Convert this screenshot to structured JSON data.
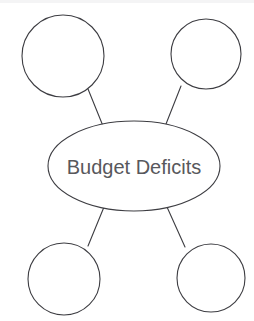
{
  "canvas": {
    "width": 254,
    "height": 321,
    "background": "#ffffff"
  },
  "diagram": {
    "type": "concept-map",
    "title": "Budget Deficits",
    "style": {
      "stroke_color": "#3d3d42",
      "stroke_width": 1.1,
      "node_fill": "#ffffff",
      "text_color": "#58585c",
      "font_size": 20
    },
    "center_node": {
      "label": "Budget Deficits",
      "shape": "ellipse",
      "cx": 134,
      "cy": 166,
      "rx": 86,
      "ry": 45
    },
    "branch_nodes": [
      {
        "name": "top-left-blank-node",
        "label": "",
        "shape": "circle",
        "cx": 63,
        "cy": 56,
        "r": 41
      },
      {
        "name": "top-right-blank-node",
        "label": "",
        "shape": "circle",
        "cx": 206,
        "cy": 54,
        "r": 35
      },
      {
        "name": "bottom-left-blank-node",
        "label": "",
        "shape": "circle",
        "cx": 64,
        "cy": 279,
        "r": 36
      },
      {
        "name": "bottom-right-blank-node",
        "label": "",
        "shape": "circle",
        "cx": 211,
        "cy": 278,
        "r": 34
      }
    ],
    "connectors": [
      {
        "name": "connector-center-to-top-left",
        "x1": 103,
        "y1": 126,
        "x2": 88,
        "y2": 89
      },
      {
        "name": "connector-center-to-top-right",
        "x1": 166,
        "y1": 124,
        "x2": 181,
        "y2": 86
      },
      {
        "name": "connector-center-to-bottom-left",
        "x1": 104,
        "y1": 207,
        "x2": 88,
        "y2": 246
      },
      {
        "name": "connector-center-to-bottom-right",
        "x1": 167,
        "y1": 207,
        "x2": 185,
        "y2": 247
      }
    ]
  }
}
